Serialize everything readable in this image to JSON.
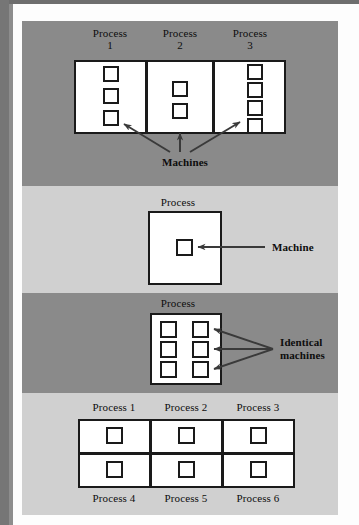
{
  "figure": {
    "colors": {
      "band_dark": "#8a8a8a",
      "band_light": "#d0d0d0",
      "box_fill": "#ffffff",
      "box_stroke": "#1a1a1a",
      "arrow": "#3a3a3a",
      "text": "#0d0d0d"
    }
  },
  "panels": [
    {
      "id": "panel-1",
      "background": "dark",
      "processes": [
        {
          "label": "Process\n1",
          "machine_count": 3
        },
        {
          "label": "Process\n2",
          "machine_count": 2
        },
        {
          "label": "Process\n3",
          "machine_count": 4
        }
      ],
      "callout": "Machines",
      "arrow_count": 3
    },
    {
      "id": "panel-2",
      "background": "light",
      "processes": [
        {
          "label": "Process",
          "machine_count": 1
        }
      ],
      "callout": "Machine",
      "arrow_count": 1
    },
    {
      "id": "panel-3",
      "background": "dark",
      "processes": [
        {
          "label": "Process",
          "machine_count": 6
        }
      ],
      "callout": "Identical\nmachines",
      "arrow_count": 3
    },
    {
      "id": "panel-4",
      "background": "light",
      "top_labels": [
        "Process 1",
        "Process 2",
        "Process 3"
      ],
      "bottom_labels": [
        "Process 4",
        "Process 5",
        "Process 6"
      ],
      "grid": {
        "columns": 3,
        "rows": 2,
        "machines_per_cell": 1
      }
    }
  ]
}
